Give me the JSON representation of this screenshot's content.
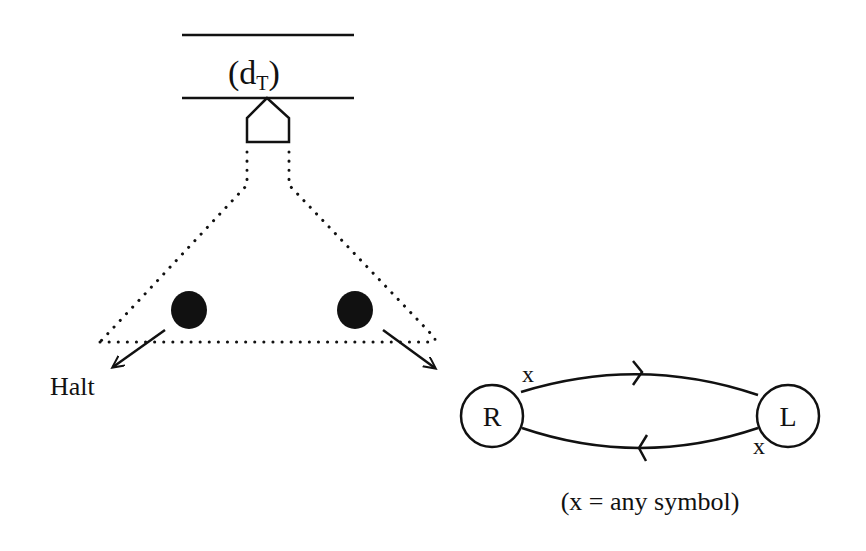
{
  "tape": {
    "label_main": "(d",
    "label_sub": "T",
    "label_close": ")"
  },
  "halt_label": "Halt",
  "machine": {
    "states": [
      {
        "id": "R",
        "label": "R"
      },
      {
        "id": "L",
        "label": "L"
      }
    ],
    "transitions": [
      {
        "from": "R",
        "to": "L",
        "symbol": "x"
      },
      {
        "from": "L",
        "to": "R",
        "symbol": "x"
      }
    ],
    "note": "(x = any symbol)"
  },
  "colors": {
    "ink": "#111111",
    "background": "#ffffff"
  }
}
